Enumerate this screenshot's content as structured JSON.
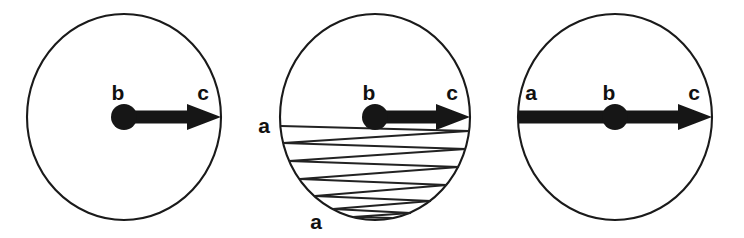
{
  "figure": {
    "background_color": "#ffffff",
    "ink_color": "#161616",
    "stroke_color": "#1a1a1a",
    "width": 744,
    "height": 238,
    "panels": [
      {
        "id": "panel-left",
        "name": "radial-ray-panel",
        "circle": {
          "cx": 124,
          "cy": 117,
          "rx": 97,
          "ry": 103
        },
        "hub": {
          "cx": 124,
          "cy": 117,
          "r": 13
        },
        "arrow": {
          "from_x": 124,
          "from_y": 117,
          "to_x": 221,
          "to_y": 117,
          "shaft_half_width": 6.5,
          "head_length": 34,
          "head_half_width": 13
        },
        "labels": [
          {
            "text": "b",
            "x": 118,
            "y": 100,
            "name": "label-b"
          },
          {
            "text": "c",
            "x": 203,
            "y": 100,
            "name": "label-c"
          }
        ],
        "bounce_path": null
      },
      {
        "id": "panel-middle",
        "name": "bouncing-chord-panel",
        "circle": {
          "cx": 375,
          "cy": 117,
          "rx": 95,
          "ry": 103
        },
        "hub": {
          "cx": 375,
          "cy": 117,
          "r": 13
        },
        "arrow": {
          "from_x": 375,
          "from_y": 117,
          "to_x": 470,
          "to_y": 117,
          "shaft_half_width": 6.5,
          "head_length": 34,
          "head_half_width": 13
        },
        "labels": [
          {
            "text": "a",
            "x": 264,
            "y": 133,
            "name": "label-a-upper-left"
          },
          {
            "text": "b",
            "x": 369,
            "y": 100,
            "name": "label-b"
          },
          {
            "text": "c",
            "x": 452,
            "y": 100,
            "name": "label-c"
          },
          {
            "text": "a",
            "x": 316,
            "y": 229,
            "name": "label-a-lower"
          }
        ],
        "bounce_path": {
          "description": "zigzag chord trajectory reflecting between left and right arcs, descending",
          "points": [
            [
              281,
              126
            ],
            [
              469,
              131
            ],
            [
              283,
              143
            ],
            [
              466,
              149
            ],
            [
              289,
              161
            ],
            [
              459,
              167
            ],
            [
              300,
              179
            ],
            [
              447,
              185
            ],
            [
              315,
              196
            ],
            [
              431,
              201
            ],
            [
              333,
              209
            ],
            [
              411,
              213
            ],
            [
              353,
              217
            ],
            [
              392,
              218
            ]
          ]
        }
      },
      {
        "id": "panel-right",
        "name": "diameter-ray-panel",
        "circle": {
          "cx": 615,
          "cy": 117,
          "rx": 97,
          "ry": 103
        },
        "hub": {
          "cx": 615,
          "cy": 117,
          "r": 13
        },
        "arrow": {
          "from_x": 518,
          "from_y": 117,
          "to_x": 712,
          "to_y": 117,
          "shaft_half_width": 6.5,
          "head_length": 34,
          "head_half_width": 13
        },
        "labels": [
          {
            "text": "a",
            "x": 531,
            "y": 100,
            "name": "label-a"
          },
          {
            "text": "b",
            "x": 609,
            "y": 100,
            "name": "label-b"
          },
          {
            "text": "c",
            "x": 694,
            "y": 100,
            "name": "label-c"
          }
        ],
        "bounce_path": null
      }
    ]
  }
}
